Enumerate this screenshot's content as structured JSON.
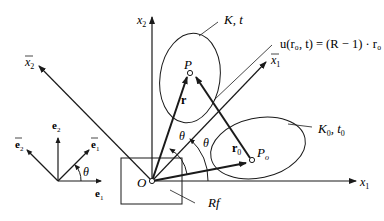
{
  "diagram": {
    "colors": {
      "stroke": "#1a1a1a",
      "background": "#ffffff"
    },
    "labels": {
      "x1": "x",
      "x1_sub": "1",
      "x2": "x",
      "x2_sub": "2",
      "x1bar": "x",
      "x1bar_sub": "1",
      "x2bar": "x",
      "x2bar_sub": "2",
      "origin": "O",
      "frame": "Rf",
      "P": "P",
      "Po": "P",
      "Po_sub": "o",
      "r": "r",
      "r0": "r",
      "r0_sub": "0",
      "theta": "θ",
      "body_current": "K, t",
      "body_initial_K": "K",
      "body_initial_sub": "0",
      "body_initial_t": ", t",
      "e1": "e",
      "e1_sub": "1",
      "e2": "e",
      "e2_sub": "2",
      "e1bar": "e",
      "e1bar_sub": "1",
      "e2bar": "e",
      "e2bar_sub": "2",
      "equation": "u(r₀, t) = (R − 1) · r₀"
    }
  }
}
